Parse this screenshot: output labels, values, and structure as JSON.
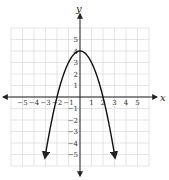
{
  "chart_data": {
    "type": "line",
    "title": "",
    "xlabel": "x",
    "ylabel": "y",
    "xlim": [
      -6,
      6
    ],
    "ylim": [
      -6,
      6
    ],
    "grid": true,
    "xticks": [
      -5,
      -4,
      -3,
      -2,
      -1,
      1,
      2,
      3,
      4,
      5
    ],
    "yticks": [
      -5,
      -4,
      -3,
      -2,
      -1,
      1,
      2,
      3,
      4,
      5
    ],
    "series": [
      {
        "name": "y = -x^2 + 4",
        "x": [
          -3,
          -2.5,
          -2,
          -1.5,
          -1,
          -0.5,
          0,
          0.5,
          1,
          1.5,
          2,
          2.5,
          3
        ],
        "y": [
          -5,
          -2.25,
          0,
          1.75,
          3,
          3.75,
          4,
          3.75,
          3,
          1.75,
          0,
          -2.25,
          -5
        ]
      }
    ],
    "vertex": [
      0,
      4
    ],
    "x_intercepts": [
      -2,
      2
    ],
    "ends_with_arrows": true
  },
  "labels": {
    "x_axis": "x",
    "y_axis": "y"
  },
  "colors": {
    "grid": "#d4d4d4",
    "axis": "#222222",
    "curve": "#111111"
  }
}
